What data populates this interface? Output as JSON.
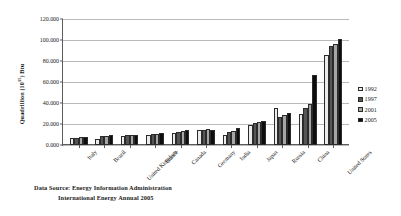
{
  "chart_data": {
    "type": "bar",
    "title": "",
    "xlabel": "",
    "ylabel": "Quadrillion (1015) Btu",
    "ylabel_main": "Quadrillion (10",
    "ylabel_exp": "15",
    "ylabel_tail": ") Btu",
    "ylim": [
      0,
      120000
    ],
    "ytick_step": 20000,
    "ytick_labels": [
      "0.000",
      "20.000",
      "40.000",
      "60.000",
      "80.000",
      "100.000",
      "120.000"
    ],
    "ytick_values": [
      0,
      20000,
      40000,
      60000,
      80000,
      100000,
      120000
    ],
    "grid": true,
    "legend_position": "right",
    "categories": [
      "Italy",
      "Brazil",
      "United Kingdom",
      "France",
      "Canada",
      "Germany",
      "India",
      "Japan",
      "Russia",
      "China",
      "United States"
    ],
    "series": [
      {
        "name": "1992",
        "color": "#eceaea",
        "values": [
          6500,
          5600,
          9000,
          9800,
          11200,
          14200,
          9600,
          19500,
          34800,
          29500,
          86000
        ]
      },
      {
        "name": "1997",
        "color": "#565656",
        "values": [
          6800,
          8300,
          9400,
          10300,
          12400,
          14300,
          12200,
          21300,
          27000,
          35000,
          94500
        ]
      },
      {
        "name": "2001",
        "color": "#a6a6a6",
        "values": [
          7400,
          8700,
          9700,
          10600,
          12900,
          14800,
          13400,
          21700,
          28500,
          38800,
          96500
        ]
      },
      {
        "name": "2005",
        "color": "#0d0d0d",
        "values": [
          7900,
          9200,
          10000,
          11000,
          14000,
          14300,
          16000,
          22400,
          30500,
          67000,
          100500
        ]
      }
    ]
  },
  "legend": {
    "entries": [
      {
        "label": "1992",
        "color": "#eceaea"
      },
      {
        "label": "1997",
        "color": "#565656"
      },
      {
        "label": "2001",
        "color": "#a6a6a6"
      },
      {
        "label": "2005",
        "color": "#0d0d0d"
      }
    ]
  },
  "caption": {
    "line1": "Data Source: Energy Information Administration",
    "line2": "International Energy Annual 2005"
  }
}
